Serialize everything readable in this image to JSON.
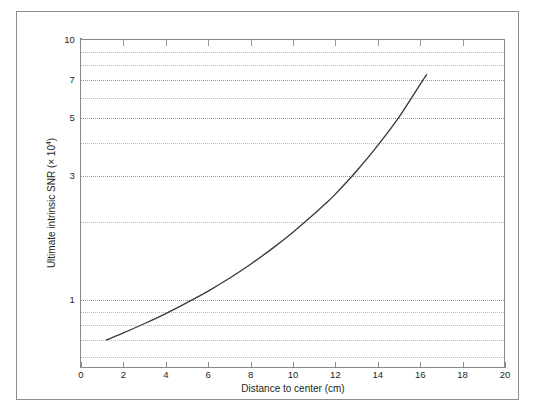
{
  "figure": {
    "frame_color": "#8d8d8d",
    "axis_color": "#8a8a8a",
    "grid_color": "#b9b9b9",
    "curve_color": "#3b3b3b",
    "background": "#ffffff"
  },
  "chart_data": {
    "type": "line",
    "title": "",
    "subtitle": "",
    "xlabel": "Distance to center (cm)",
    "ylabel_text": "Ultimate intrinsic SNR (× 10",
    "ylabel_sup": "4",
    "ylabel_tail": ")",
    "ylabel_full": "Ultimate intrinsic SNR (× 10⁴)",
    "xscale": "linear",
    "yscale": "log",
    "xlim": [
      0,
      20
    ],
    "ylim": [
      0.546,
      10
    ],
    "grid": true,
    "legend": "none",
    "xticks": [
      0,
      2,
      4,
      6,
      8,
      10,
      12,
      14,
      16,
      18,
      20
    ],
    "xticklabels": [
      "0",
      "2",
      "4",
      "6",
      "8",
      "10",
      "12",
      "14",
      "16",
      "18",
      "20"
    ],
    "yticks_major": [
      1,
      3,
      5,
      7,
      10
    ],
    "yticklabels_major": [
      "1",
      "3",
      "5",
      "7",
      "10"
    ],
    "yticks_minor": [
      0.6,
      0.7,
      0.8,
      0.9,
      2,
      4,
      6,
      8,
      9
    ],
    "ygridlines": [
      0.6,
      0.7,
      0.8,
      0.9,
      1,
      2,
      3,
      4,
      5,
      6,
      7,
      8,
      9
    ],
    "series": [
      {
        "name": "Ultimate intrinsic SNR",
        "x": [
          1.2,
          2.0,
          3.0,
          4.0,
          5.0,
          6.0,
          7.0,
          8.0,
          9.0,
          10.0,
          11.0,
          11.5,
          12.0,
          13.0,
          14.0,
          15.0,
          16.0,
          16.3
        ],
        "y": [
          0.7,
          0.745,
          0.81,
          0.885,
          0.975,
          1.08,
          1.21,
          1.37,
          1.57,
          1.82,
          2.14,
          2.33,
          2.55,
          3.13,
          3.93,
          5.05,
          6.75,
          7.35
        ]
      }
    ]
  }
}
